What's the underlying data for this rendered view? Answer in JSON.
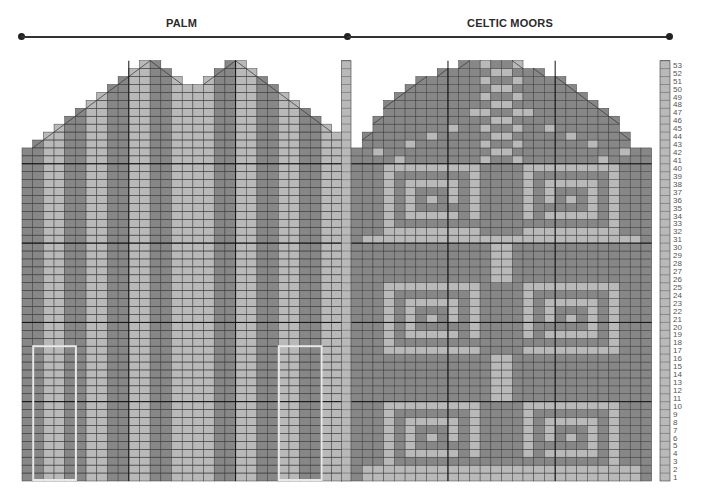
{
  "titles": {
    "palm": "PALM",
    "celtic": "CELTIC MOORS"
  },
  "colors": {
    "dark": "#878787",
    "light": "#b9b9b9",
    "grid": "#3e3e3e",
    "bold": "#111111",
    "highlight": "#e8e8e8"
  },
  "rows": {
    "count": 53,
    "labels": [
      "1",
      "2",
      "3",
      "4",
      "5",
      "6",
      "7",
      "8",
      "9",
      "10",
      "11",
      "12",
      "13",
      "14",
      "15",
      "16",
      "17",
      "18",
      "19",
      "20",
      "21",
      "22",
      "23",
      "24",
      "25",
      "26",
      "27",
      "28",
      "29",
      "30",
      "31",
      "32",
      "33",
      "34",
      "35",
      "36",
      "37",
      "38",
      "39",
      "40",
      "41",
      "42",
      "43",
      "44",
      "45",
      "46",
      "47",
      "48",
      "49",
      "50",
      "51",
      "52",
      "53"
    ]
  },
  "palm": {
    "columns": 30,
    "stripe_pattern": [
      "dark",
      "dark",
      "light",
      "light",
      "dark",
      "dark",
      "light",
      "light",
      "dark",
      "dark",
      "light",
      "light",
      "dark",
      "dark",
      "light",
      "light",
      "light",
      "light",
      "dark",
      "dark",
      "light",
      "light",
      "dark",
      "dark",
      "light",
      "light",
      "dark",
      "dark",
      "light",
      "light"
    ],
    "top_row_by_column": [
      42,
      43,
      44,
      45,
      46,
      47,
      48,
      49,
      50,
      51,
      52,
      53,
      53,
      52,
      51,
      50,
      50,
      51,
      52,
      53,
      53,
      52,
      51,
      50,
      49,
      48,
      47,
      46,
      45,
      44
    ],
    "repeat_boxes": [
      {
        "label": "repeat-box-left",
        "from_col": 1,
        "to_col": 5,
        "from_row": 1,
        "to_row": 17
      },
      {
        "label": "repeat-box-right",
        "from_col": 24,
        "to_col": 28,
        "from_row": 1,
        "to_row": 17
      }
    ]
  },
  "celtic": {
    "columns": 28,
    "top_row_by_column": [
      42,
      44,
      46,
      48,
      49,
      50,
      51,
      51,
      52,
      52,
      53,
      53,
      53,
      53,
      53,
      53,
      52,
      52,
      51,
      51,
      50,
      49,
      48,
      47,
      46,
      44,
      42,
      42
    ]
  },
  "side_strips": {
    "left_top_row": 53,
    "right_top_row": 53
  }
}
